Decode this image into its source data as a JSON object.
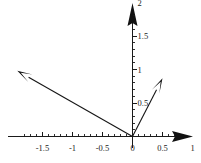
{
  "figure": {
    "background_color": "#ffffff",
    "ink_color": "#1a1a1a",
    "width": 201,
    "height": 163
  },
  "chart_data": {
    "type": "scatter",
    "title": "",
    "subtitle": "",
    "xlabel": "",
    "ylabel": "",
    "grid": false,
    "legend": null,
    "xlim": [
      -2.2,
      1.15
    ],
    "ylim": [
      -0.12,
      2.0
    ],
    "x_ticks": [
      -1.5,
      -1,
      -0.5,
      0,
      0.5,
      1
    ],
    "x_tick_labels": [
      "-1.5",
      "-1",
      "-0.5",
      "0",
      "0.5",
      "1"
    ],
    "x_minor_tick_step": 0.1,
    "y_ticks": [
      0,
      0.5,
      1,
      1.5,
      2
    ],
    "y_tick_labels": [
      "0",
      "0.5",
      "1",
      "1.5",
      "2"
    ],
    "y_minor_tick_step": 0.1,
    "axis_arrows": [
      "x-positive",
      "y-positive"
    ],
    "origin": [
      0,
      0
    ],
    "vectors": [
      {
        "name": "vector-left",
        "tail": [
          0,
          0
        ],
        "head": [
          -1.92,
          0.98
        ],
        "color": "#111111"
      },
      {
        "name": "vector-right",
        "tail": [
          0,
          0
        ],
        "head": [
          0.5,
          0.87
        ],
        "color": "#111111"
      }
    ]
  },
  "labels": {
    "x": [
      {
        "id": "x-neg-1-5",
        "text": "-1.5",
        "value": -1.5
      },
      {
        "id": "x-neg-1",
        "text": "-1",
        "value": -1
      },
      {
        "id": "x-neg-0-5",
        "text": "-0.5",
        "value": -0.5
      },
      {
        "id": "x-0",
        "text": "0",
        "value": 0
      },
      {
        "id": "x-0-5",
        "text": "0.5",
        "value": 0.5
      },
      {
        "id": "x-1",
        "text": "1",
        "value": 1
      }
    ],
    "y": [
      {
        "id": "y-0-5",
        "text": "0.5",
        "value": 0.5
      },
      {
        "id": "y-1",
        "text": "1",
        "value": 1
      },
      {
        "id": "y-1-5",
        "text": "1.5",
        "value": 1.5
      },
      {
        "id": "y-2",
        "text": "2",
        "value": 2
      }
    ]
  }
}
